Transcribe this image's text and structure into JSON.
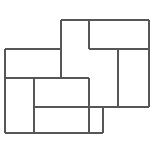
{
  "figure": {
    "title": "",
    "caption": "",
    "type": "geometric-tiling-diagram",
    "canvas": {
      "width": 158,
      "height": 145,
      "background": "#ffffff"
    },
    "style": {
      "stroke_color": "#565656",
      "stroke_width": 2,
      "fill_color": "#ffffff",
      "line_cap": "butt"
    },
    "segments": [
      {
        "name": "top-edge",
        "orientation": "horizontal",
        "x1": 61,
        "y1": 20,
        "x2": 149,
        "y2": 20
      },
      {
        "name": "upper-mid-left",
        "orientation": "horizontal",
        "x1": 5,
        "y1": 49,
        "x2": 61,
        "y2": 49
      },
      {
        "name": "upper-mid-right",
        "orientation": "horizontal",
        "x1": 89,
        "y1": 49,
        "x2": 149,
        "y2": 49
      },
      {
        "name": "center-horizontal",
        "orientation": "horizontal",
        "x1": 5,
        "y1": 78,
        "x2": 89,
        "y2": 78
      },
      {
        "name": "lower-mid-horizontal",
        "orientation": "horizontal",
        "x1": 34,
        "y1": 107,
        "x2": 149,
        "y2": 107
      },
      {
        "name": "bottom-edge",
        "orientation": "horizontal",
        "x1": 5,
        "y1": 133,
        "x2": 103,
        "y2": 133
      },
      {
        "name": "left-edge",
        "orientation": "vertical",
        "x1": 5,
        "y1": 49,
        "x2": 5,
        "y2": 133
      },
      {
        "name": "inner-left-vertical",
        "orientation": "vertical",
        "x1": 34,
        "y1": 78,
        "x2": 34,
        "y2": 133
      },
      {
        "name": "center-left-vertical",
        "orientation": "vertical",
        "x1": 61,
        "y1": 20,
        "x2": 61,
        "y2": 78
      },
      {
        "name": "center-right-vertical-upper",
        "orientation": "vertical",
        "x1": 89,
        "y1": 20,
        "x2": 89,
        "y2": 49
      },
      {
        "name": "center-right-vertical-lower",
        "orientation": "vertical",
        "x1": 89,
        "y1": 78,
        "x2": 89,
        "y2": 133
      },
      {
        "name": "bottom-right-vertical",
        "orientation": "vertical",
        "x1": 103,
        "y1": 107,
        "x2": 103,
        "y2": 133
      },
      {
        "name": "right-inner-vertical",
        "orientation": "vertical",
        "x1": 118,
        "y1": 49,
        "x2": 118,
        "y2": 107
      },
      {
        "name": "right-edge",
        "orientation": "vertical",
        "x1": 149,
        "y1": 20,
        "x2": 149,
        "y2": 107
      }
    ],
    "tiles": [
      {
        "name": "tile-top-left",
        "x": 61,
        "y": 20,
        "width": 28,
        "height": 58
      },
      {
        "name": "tile-top-right",
        "x": 89,
        "y": 20,
        "width": 60,
        "height": 29
      },
      {
        "name": "tile-right-upper",
        "x": 89,
        "y": 49,
        "width": 29,
        "height": 58
      },
      {
        "name": "tile-right-lower",
        "x": 118,
        "y": 49,
        "width": 31,
        "height": 58
      },
      {
        "name": "tile-left-upper",
        "x": 5,
        "y": 49,
        "width": 56,
        "height": 29
      },
      {
        "name": "tile-left-lower",
        "x": 5,
        "y": 78,
        "width": 29,
        "height": 55
      },
      {
        "name": "tile-center-lower",
        "x": 34,
        "y": 78,
        "width": 55,
        "height": 29
      },
      {
        "name": "tile-bottom",
        "x": 34,
        "y": 107,
        "width": 69,
        "height": 26
      }
    ]
  }
}
